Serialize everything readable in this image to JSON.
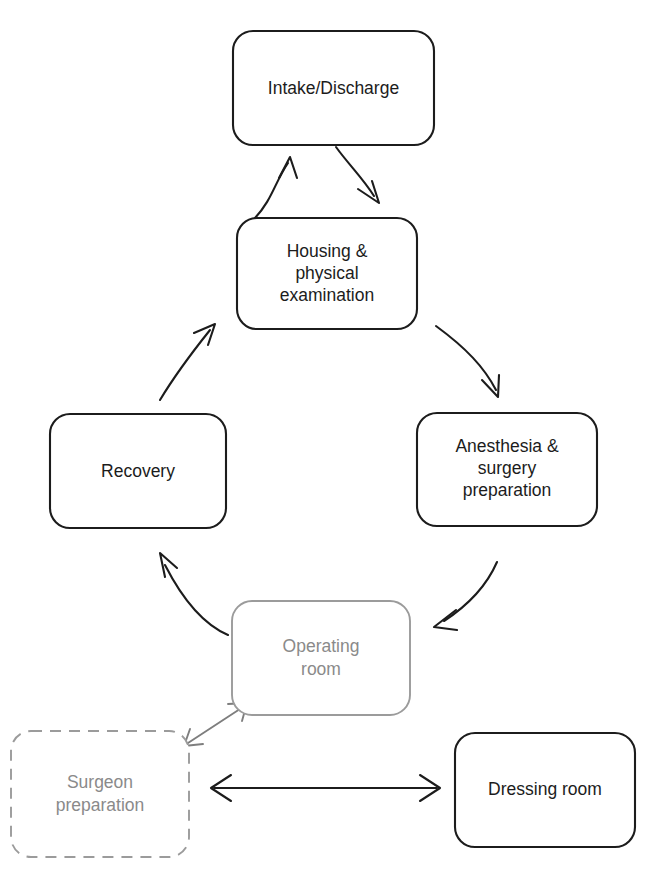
{
  "diagram": {
    "type": "flow-cycle",
    "colors": {
      "stroke_dark": "#1c1c1c",
      "stroke_light": "#9b9b9b",
      "text_dark": "#1c1c1c",
      "text_muted": "#8a8a8a",
      "background": "#ffffff"
    },
    "nodes": [
      {
        "id": "intake-discharge",
        "label": "Intake/Discharge",
        "lines": [
          "Intake/Discharge"
        ],
        "style": "solid",
        "x": 233,
        "y": 31,
        "w": 201,
        "h": 114
      },
      {
        "id": "housing-physical-examination",
        "label": "Housing & physical examination",
        "lines": [
          "Housing &",
          "physical",
          "examination"
        ],
        "style": "solid",
        "x": 237,
        "y": 218,
        "w": 180,
        "h": 111
      },
      {
        "id": "anesthesia-surgery-preparation",
        "label": "Anesthesia & surgery preparation",
        "lines": [
          "Anesthesia &",
          "surgery",
          "preparation"
        ],
        "style": "solid",
        "x": 417,
        "y": 413,
        "w": 180,
        "h": 113
      },
      {
        "id": "recovery",
        "label": "Recovery",
        "lines": [
          "Recovery"
        ],
        "style": "solid",
        "x": 50,
        "y": 414,
        "w": 176,
        "h": 114
      },
      {
        "id": "operating-room",
        "label": "Operating room",
        "lines": [
          "Operating",
          "room"
        ],
        "style": "light",
        "x": 232,
        "y": 601,
        "w": 178,
        "h": 114
      },
      {
        "id": "surgeon-preparation",
        "label": "Surgeon preparation",
        "lines": [
          "Surgeon",
          "preparation"
        ],
        "style": "dashed",
        "x": 11,
        "y": 731,
        "w": 178,
        "h": 126
      },
      {
        "id": "dressing-room",
        "label": "Dressing room",
        "lines": [
          "Dressing room"
        ],
        "style": "solid",
        "x": 455,
        "y": 733,
        "w": 180,
        "h": 114
      }
    ],
    "edges": [
      {
        "id": "intake-to-housing",
        "from": "intake-discharge",
        "to": "housing-physical-examination",
        "direction": "single",
        "style": "dark"
      },
      {
        "id": "housing-to-intake",
        "from": "housing-physical-examination",
        "to": "intake-discharge",
        "direction": "single",
        "style": "dark"
      },
      {
        "id": "housing-to-anesthesia",
        "from": "housing-physical-examination",
        "to": "anesthesia-surgery-preparation",
        "direction": "single",
        "style": "dark"
      },
      {
        "id": "anesthesia-to-operating-room",
        "from": "anesthesia-surgery-preparation",
        "to": "operating-room",
        "direction": "single",
        "style": "dark"
      },
      {
        "id": "operating-room-to-recovery",
        "from": "operating-room",
        "to": "recovery",
        "direction": "single",
        "style": "dark"
      },
      {
        "id": "recovery-to-housing",
        "from": "recovery",
        "to": "housing-physical-examination",
        "direction": "single",
        "style": "dark"
      },
      {
        "id": "operating-room-surgeon-preparation",
        "from": "operating-room",
        "to": "surgeon-preparation",
        "direction": "double",
        "style": "light"
      },
      {
        "id": "surgeon-preparation-dressing-room",
        "from": "surgeon-preparation",
        "to": "dressing-room",
        "direction": "double",
        "style": "dark"
      }
    ]
  }
}
